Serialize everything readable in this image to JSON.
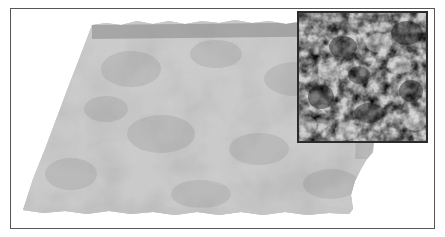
{
  "figure": {
    "width": 445,
    "height": 237,
    "background_color": "#ffffff",
    "caption": "",
    "title": ""
  },
  "frame": {
    "border_color": "#565656",
    "border_width_px": 1,
    "x": 10,
    "y": 8,
    "width": 425,
    "height": 221
  },
  "surface_plot": {
    "description": "3D rendered rough self-affine surface shown in perspective, light gray with mottled blotchy height shading and ragged torn edges",
    "base_color": "#a9a9a9",
    "light_color": "#c2c2c2",
    "dark_color": "#8f8f8f",
    "edge_shadow_color": "#6f6f6f",
    "corners": {
      "top_left": [
        92,
        24
      ],
      "top_right": [
        355,
        22
      ],
      "right": [
        373,
        152
      ],
      "bottom_right": [
        352,
        212
      ],
      "bottom_left": [
        22,
        210
      ]
    },
    "roughness": "fractal",
    "projection": "perspective"
  },
  "inset": {
    "description": "Grayscale top-down height map of the same rough surface, high contrast noise texture",
    "x": 297,
    "y": 11,
    "width": 131,
    "height": 132,
    "border_color": "#2b2b2b",
    "border_width_px": 2,
    "colormap": "gray",
    "min_color": "#141414",
    "max_color": "#e8e8e8",
    "mid_color": "#808080"
  },
  "chart_data": {
    "type": "heatmap",
    "title": "",
    "xlabel": "",
    "ylabel": "",
    "colormap": "gray",
    "grid": false,
    "legend": "none",
    "panels": [
      {
        "name": "surface-3d",
        "type": "surface",
        "render": "perspective 3D rough surface",
        "value_range": [
          0.0,
          1.0
        ],
        "color_range": [
          "#8a8a8a",
          "#c6c6c6"
        ]
      },
      {
        "name": "inset-heightmap",
        "type": "heatmap",
        "render": "top-down grayscale height field",
        "value_range": [
          0.0,
          1.0
        ],
        "color_range": [
          "#141414",
          "#e8e8e8"
        ]
      }
    ]
  }
}
